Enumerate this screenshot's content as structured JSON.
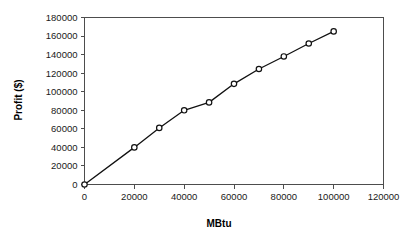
{
  "chart_data": {
    "type": "line",
    "title": "",
    "subtitle": "",
    "xlabel": "MBtu",
    "ylabel": "Profit ($)",
    "xlim": [
      0,
      120000
    ],
    "ylim": [
      0,
      180000
    ],
    "xticks": [
      0,
      20000,
      40000,
      60000,
      80000,
      100000,
      120000
    ],
    "yticks": [
      0,
      20000,
      40000,
      60000,
      80000,
      100000,
      120000,
      140000,
      160000,
      180000
    ],
    "xtick_labels": [
      "0",
      "20000",
      "40000",
      "60000",
      "80000",
      "100000",
      "120000"
    ],
    "ytick_labels": [
      "0",
      "20000",
      "40000",
      "60000",
      "80000",
      "100000",
      "120000",
      "140000",
      "160000",
      "180000"
    ],
    "grid": false,
    "legend": false,
    "legend_position": "none",
    "marker": "open-circle",
    "line_color": "#111111",
    "marker_fill_color": "#ffffff",
    "marker_edge_color": "#111111",
    "frame_color": "#4d4d4d",
    "background_color": "#ffffff",
    "x": [
      0,
      20000,
      30000,
      40000,
      50000,
      60000,
      70000,
      80000,
      90000,
      100000
    ],
    "values": [
      0,
      40000,
      61000,
      80000,
      88500,
      108500,
      124500,
      138000,
      152000,
      165000
    ],
    "series": [
      {
        "name": "Profit",
        "x": [
          0,
          20000,
          30000,
          40000,
          50000,
          60000,
          70000,
          80000,
          90000,
          100000
        ],
        "values": [
          0,
          40000,
          61000,
          80000,
          88500,
          108500,
          124500,
          138000,
          152000,
          165000
        ]
      }
    ],
    "annotations": []
  }
}
